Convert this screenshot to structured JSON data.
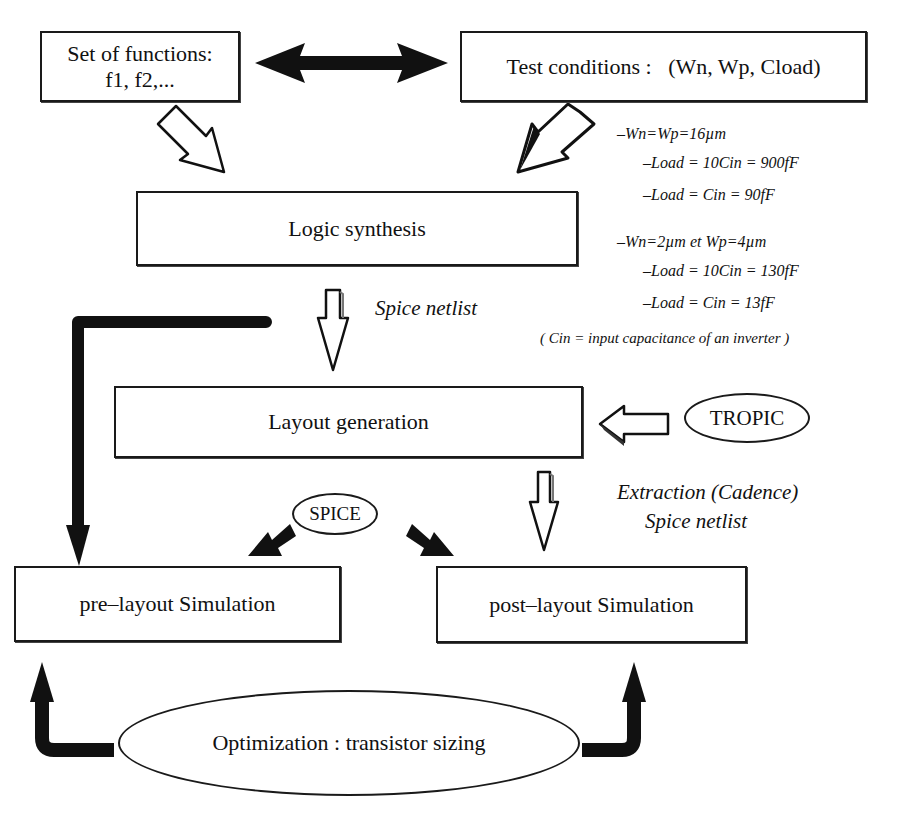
{
  "diagram": {
    "type": "flowchart",
    "nodes": {
      "functions": {
        "line1": "Set of functions:",
        "line2": "f1, f2,..."
      },
      "test_conditions": {
        "label": "Test conditions :   (Wn, Wp, Cload)"
      },
      "logic_synthesis": {
        "label": "Logic synthesis"
      },
      "layout_generation": {
        "label": "Layout generation"
      },
      "tropic": {
        "label": "TROPIC"
      },
      "spice": {
        "label": "SPICE"
      },
      "pre_layout": {
        "label": "pre–layout Simulation"
      },
      "post_layout": {
        "label": "post–layout Simulation"
      },
      "optimization": {
        "label": "Optimization : transistor sizing"
      }
    },
    "annotations": {
      "spice_netlist": "Spice netlist",
      "extraction_line1": "Extraction (Cadence)",
      "extraction_line2": "Spice netlist",
      "conditions": [
        "–Wn=Wp=16µm",
        "–Load = 10Cin = 900fF",
        "–Load = Cin = 90fF",
        "–Wn=2µm et Wp=4µm",
        "–Load = 10Cin = 130fF",
        "–Load = Cin = 13fF"
      ],
      "cin_note": "( Cin = input capacitance of an inverter )"
    },
    "edges": [
      {
        "from": "functions",
        "to": "test_conditions",
        "style": "double-arrow"
      },
      {
        "from": "functions",
        "to": "logic_synthesis",
        "style": "hollow-arrow"
      },
      {
        "from": "test_conditions",
        "to": "logic_synthesis",
        "style": "hollow-arrow"
      },
      {
        "from": "logic_synthesis",
        "to": "layout_generation",
        "style": "hollow-arrow",
        "label": "Spice netlist"
      },
      {
        "from": "logic_synthesis",
        "to": "pre_layout",
        "style": "black-elbow-arrow"
      },
      {
        "from": "tropic",
        "to": "layout_generation",
        "style": "hollow-arrow"
      },
      {
        "from": "layout_generation",
        "to": "post_layout",
        "style": "hollow-arrow",
        "label": "Extraction (Cadence) Spice netlist"
      },
      {
        "from": "spice",
        "to": "pre_layout",
        "style": "black-arrow"
      },
      {
        "from": "spice",
        "to": "post_layout",
        "style": "black-arrow"
      },
      {
        "from": "optimization",
        "to": "pre_layout",
        "style": "black-elbow-arrow"
      },
      {
        "from": "optimization",
        "to": "post_layout",
        "style": "black-elbow-arrow"
      }
    ]
  }
}
